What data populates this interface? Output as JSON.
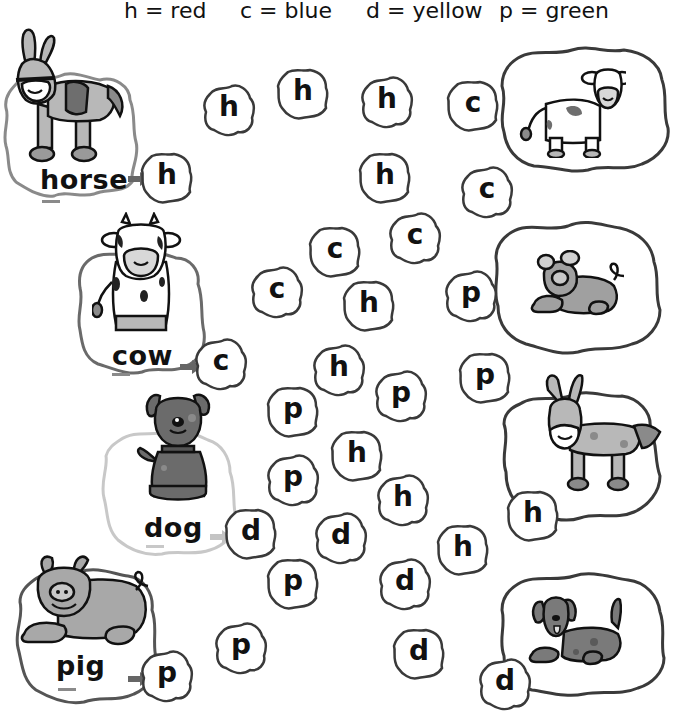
{
  "legend": {
    "items": [
      {
        "letter": "h",
        "text": "h = red",
        "color": "#d32f2f"
      },
      {
        "letter": "c",
        "text": "c = blue",
        "color": "#1e63c8"
      },
      {
        "letter": "d",
        "text": "d = yellow",
        "color": "#f2c40f"
      },
      {
        "letter": "p",
        "text": "p = green",
        "color": "#2e9b3e"
      }
    ]
  },
  "examples": [
    {
      "word": "horse",
      "first_letter": "h",
      "animal": "donkey-icon"
    },
    {
      "word": "cow",
      "first_letter": "c",
      "animal": "cow-icon"
    },
    {
      "word": "dog",
      "first_letter": "d",
      "animal": "dog-icon"
    },
    {
      "word": "pig",
      "first_letter": "p",
      "animal": "pig-icon"
    }
  ],
  "right_pictures": [
    {
      "animal": "cow-icon"
    },
    {
      "animal": "pig-icon"
    },
    {
      "animal": "donkey-icon"
    },
    {
      "animal": "dog-icon"
    }
  ],
  "blobs": [
    {
      "letter": "h"
    },
    {
      "letter": "h"
    },
    {
      "letter": "h"
    },
    {
      "letter": "c"
    },
    {
      "letter": "h"
    },
    {
      "letter": "c"
    },
    {
      "letter": "c"
    },
    {
      "letter": "c"
    },
    {
      "letter": "c"
    },
    {
      "letter": "h"
    },
    {
      "letter": "p"
    },
    {
      "letter": "h"
    },
    {
      "letter": "p"
    },
    {
      "letter": "p"
    },
    {
      "letter": "p"
    },
    {
      "letter": "h"
    },
    {
      "letter": "p"
    },
    {
      "letter": "h"
    },
    {
      "letter": "h"
    },
    {
      "letter": "d"
    },
    {
      "letter": "h"
    },
    {
      "letter": "p"
    },
    {
      "letter": "d"
    },
    {
      "letter": "p"
    },
    {
      "letter": "d"
    },
    {
      "letter": "d"
    }
  ],
  "colors": {
    "outline": "#3a3a3a",
    "light_outline": "#c8c8c8",
    "arrow": "#666666",
    "light_arrow": "#c4c4c4",
    "animal_fill": "#b5b5b5",
    "animal_dark": "#6e6e6e"
  }
}
